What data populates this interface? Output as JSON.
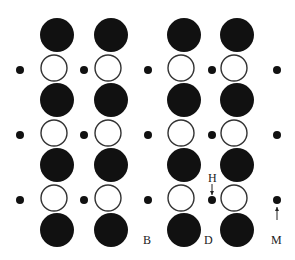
{
  "diagram": {
    "colors": {
      "big_atom": "#111111",
      "open_atom_stroke": "#333333",
      "small_atom": "#111111",
      "background": "#ffffff"
    },
    "groups": [
      {
        "columns": [
          57,
          111
        ]
      },
      {
        "columns": [
          184,
          237
        ]
      }
    ],
    "black_rows": [
      35,
      100,
      165,
      230
    ],
    "white_rows": [
      68,
      133,
      198
    ],
    "small_dot_columns": [
      20,
      84,
      148,
      212,
      277
    ],
    "small_dot_rows": [
      70,
      135,
      200
    ],
    "radii": {
      "big": 17,
      "open": 13,
      "small": 4
    },
    "labels": [
      {
        "id": "B",
        "text": "B",
        "x": 143,
        "y": 234
      },
      {
        "id": "D",
        "text": "D",
        "x": 204,
        "y": 234
      },
      {
        "id": "H",
        "text": "H",
        "x": 208,
        "y": 172
      },
      {
        "id": "M",
        "text": "M",
        "x": 271,
        "y": 234
      }
    ],
    "arrows": [
      {
        "id": "H-arrow",
        "x": 212,
        "y1": 184,
        "y2": 195,
        "direction": "down"
      },
      {
        "id": "M-arrow",
        "x": 277,
        "y1": 220,
        "y2": 207,
        "direction": "up"
      }
    ]
  }
}
